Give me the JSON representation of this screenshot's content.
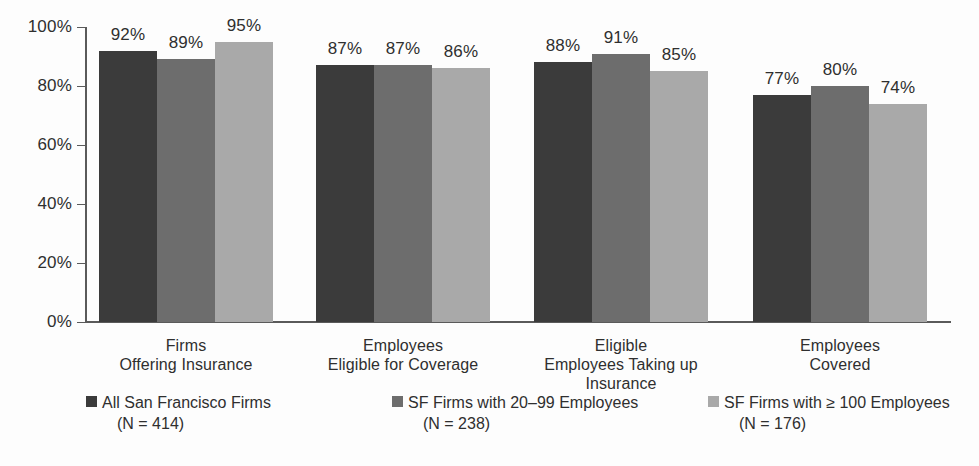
{
  "chart_data": {
    "type": "bar",
    "title": "",
    "subtitle": "",
    "xlabel": "",
    "ylabel": "",
    "ylim": [
      0,
      100
    ],
    "ytick_labels": [
      "0%",
      "20%",
      "40%",
      "60%",
      "80%",
      "100%"
    ],
    "ytick_values": [
      0,
      20,
      40,
      60,
      80,
      100
    ],
    "grid": false,
    "legend_position": "bottom",
    "categories": [
      "Firms\nOffering Insurance",
      "Employees\nEligible for Coverage",
      "Eligible\nEmployees Taking up\nInsurance",
      "Employees\nCovered"
    ],
    "category_lines": [
      [
        "Firms",
        "Offering Insurance"
      ],
      [
        "Employees",
        "Eligible for Coverage"
      ],
      [
        "Eligible",
        "Employees Taking up",
        "Insurance"
      ],
      [
        "Employees",
        "Covered"
      ]
    ],
    "series": [
      {
        "name": "All San Francisco Firms",
        "n_label": "(N = 414)",
        "color": "#3b3b3b",
        "values": [
          92,
          87,
          88,
          77
        ],
        "value_labels": [
          "92%",
          "87%",
          "88%",
          "77%"
        ]
      },
      {
        "name": "SF Firms with 20–99 Employees",
        "n_label": "(N = 238)",
        "color": "#6d6d6d",
        "values": [
          89,
          87,
          91,
          80
        ],
        "value_labels": [
          "89%",
          "87%",
          "91%",
          "80%"
        ]
      },
      {
        "name": "SF Firms with ≥ 100 Employees",
        "n_label": "(N = 176)",
        "color": "#a9a9a9",
        "values": [
          95,
          86,
          85,
          74
        ],
        "value_labels": [
          "95%",
          "86%",
          "85%",
          "74%"
        ]
      }
    ]
  },
  "axis": {
    "y": {
      "labels": [
        "100%",
        "80%",
        "60%",
        "40%",
        "20%",
        "0%"
      ]
    }
  },
  "legend": {
    "items": [
      {
        "label": "All San Francisco Firms",
        "n": "(N = 414)",
        "color": "#3b3b3b"
      },
      {
        "label": "SF Firms with 20–99 Employees",
        "n": "(N = 238)",
        "color": "#6d6d6d"
      },
      {
        "label": "SF Firms with ≥ 100 Employees",
        "n": "(N = 176)",
        "color": "#a9a9a9"
      }
    ]
  }
}
